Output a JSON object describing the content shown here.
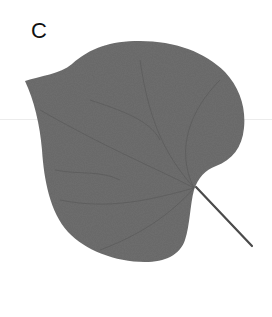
{
  "figure": {
    "panel_label": "C",
    "colors": {
      "background": "#ffffff",
      "leaf_fill": "#6e6e6e",
      "vein": "#555555",
      "petiole": "#4a4a4a",
      "label": "#111111"
    }
  }
}
